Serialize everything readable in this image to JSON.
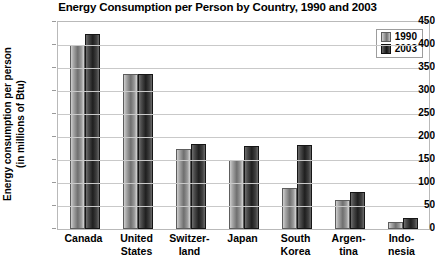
{
  "chart_data": {
    "type": "bar",
    "title": "Energy Consumption per Person by Country, 1990 and 2003",
    "xlabel": "",
    "ylabel": "Energy consumption per person\n(in millions of Btu)",
    "ylim": [
      0,
      450
    ],
    "ytick_step": 50,
    "yticks": [
      450,
      400,
      350,
      300,
      250,
      200,
      150,
      100,
      50,
      0
    ],
    "grid": true,
    "legend_position": "top-right",
    "categories": [
      "Canada",
      "United\nStates",
      "Switzer-\nland",
      "Japan",
      "South\nKorea",
      "Argen-\ntina",
      "Indo-\nnesia"
    ],
    "series": [
      {
        "name": "1990",
        "color": "#8f8f8f",
        "values": [
          400,
          338,
          175,
          150,
          90,
          63,
          15
        ]
      },
      {
        "name": "2003",
        "color": "#262626",
        "values": [
          425,
          338,
          185,
          180,
          183,
          80,
          25
        ]
      }
    ]
  },
  "legend": {
    "items": [
      {
        "label": "1990"
      },
      {
        "label": "2003"
      }
    ]
  }
}
